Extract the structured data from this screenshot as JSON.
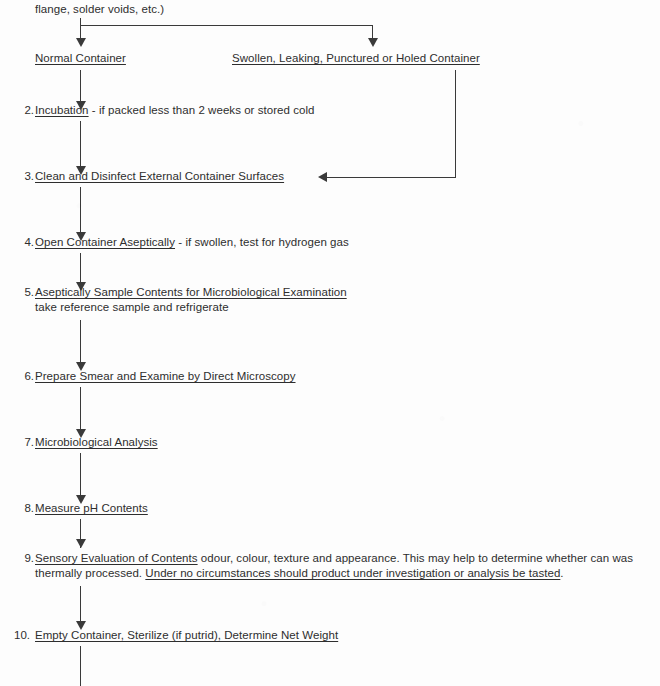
{
  "document": {
    "type": "flowchart",
    "title_fragment": "flange, solder voids, etc.)",
    "branch_left_label": "Normal Container",
    "branch_right_label": "Swollen, Leaking, Punctured or Holed Container"
  },
  "steps": [
    {
      "number": "2.",
      "heading": "Incubation",
      "detail": " - if packed less than 2 weeks or stored cold",
      "subline": ""
    },
    {
      "number": "3.",
      "heading": "Clean and Disinfect External Container Surfaces",
      "detail": "",
      "subline": ""
    },
    {
      "number": "4.",
      "heading": "Open Container Aseptically",
      "detail": " - if swollen, test for hydrogen gas",
      "subline": ""
    },
    {
      "number": "5.",
      "heading": "Aseptically Sample Contents for Microbiological Examination",
      "detail": "",
      "subline": "take reference sample and refrigerate"
    },
    {
      "number": "6.",
      "heading": "Prepare Smear and Examine by Direct Microscopy",
      "detail": "",
      "subline": ""
    },
    {
      "number": "7.",
      "heading": "Microbiological Analysis",
      "detail": "",
      "subline": ""
    },
    {
      "number": "8.",
      "heading": "Measure pH Contents",
      "detail": "",
      "subline": ""
    },
    {
      "number": "9.",
      "heading": "Sensory Evaluation of Contents",
      "detail": " odour, colour, texture and appearance.  This may help to determine whether can was thermally processed. ",
      "warning": "Under no circumstances should product under investigation or analysis be tasted",
      "warning_tail": ".",
      "subline": ""
    },
    {
      "number": "10.",
      "heading": "Empty Container, Sterilize (if putrid), Determine Net Weight",
      "detail": "",
      "subline": ""
    }
  ],
  "colors": {
    "ink": "#2e2e2e",
    "line": "#3a3a3a",
    "paper": "#fdfdfd"
  }
}
